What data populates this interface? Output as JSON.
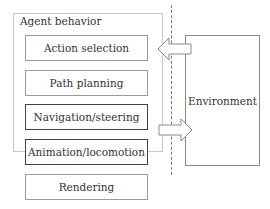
{
  "diagram": {
    "group_label": "Agent behavior",
    "layers": [
      {
        "label": "Action selection",
        "emphasized": false
      },
      {
        "label": "Path planning",
        "emphasized": false
      },
      {
        "label": "Navigation/steering",
        "emphasized": true
      },
      {
        "label": "Animation/locomotion",
        "emphasized": true
      },
      {
        "label": "Rendering",
        "emphasized": false
      }
    ],
    "environment_label": "Environment",
    "arrows": [
      {
        "from": "Environment",
        "to": "Action selection",
        "direction": "left"
      },
      {
        "from": "Navigation/steering",
        "to": "Environment",
        "direction": "right"
      }
    ],
    "colors": {
      "border": "#9a9a9a",
      "emphasis_border": "#444444",
      "group_border": "#c8c8c8",
      "text": "#333333"
    }
  }
}
